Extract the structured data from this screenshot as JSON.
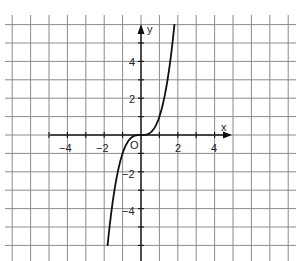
{
  "chart_data": {
    "type": "line",
    "title": "",
    "function": "y = x^3",
    "xlabel": "x",
    "ylabel": "y",
    "origin_label": "O",
    "x_ticks": [
      -4,
      -2,
      2,
      4
    ],
    "x_tick_labels": [
      "−4",
      "−2",
      "2",
      "4"
    ],
    "y_ticks": [
      4,
      2,
      -2,
      -4
    ],
    "y_tick_labels": [
      "4",
      "2",
      "−2",
      "−4"
    ],
    "xlim": [
      -7,
      8
    ],
    "ylim": [
      -7,
      6
    ],
    "grid": true,
    "grid_step": 1,
    "series": [
      {
        "name": "y = x^3",
        "x": [
          -1.82,
          -1.5,
          -1.25,
          -1,
          -0.75,
          -0.5,
          -0.25,
          0,
          0.25,
          0.5,
          0.75,
          1,
          1.25,
          1.5,
          1.8
        ],
        "values": [
          -6.03,
          -3.375,
          -1.953,
          -1,
          -0.422,
          -0.125,
          -0.016,
          0,
          0.016,
          0.125,
          0.422,
          1,
          1.953,
          3.375,
          5.83
        ]
      }
    ]
  }
}
